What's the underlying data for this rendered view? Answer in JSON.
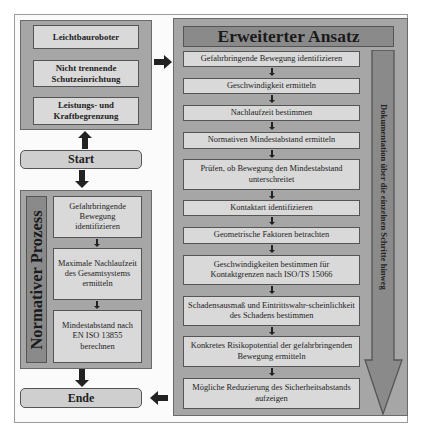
{
  "diagram": {
    "left_top_group": {
      "boxes": [
        "Leichtbauroboter",
        "Nicht trennende Schutzeinrichtung",
        "Leistungs- und Kraftbegrenzung"
      ]
    },
    "start_label": "Start",
    "normative": {
      "title": "Normativer Prozess",
      "steps": [
        "Gefahrbringende Bewegung identifizieren",
        "Maximale Nachlaufzeit des Gesamtsystems ermitteln",
        "Mindestabstand nach EN ISO 13855 berechnen"
      ]
    },
    "end_label": "Ende",
    "extended": {
      "title": "Erweiterter Ansatz",
      "steps": [
        "Gefahrbringende Bewegung identifizieren",
        "Geschwindigkeit ermitteln",
        "Nachlaufzeit bestimmen",
        "Normativen Mindestabstand ermitteln",
        "Prüfen, ob Bewegung den Mindestabstand unterschreitet",
        "Kontaktart identifizieren",
        "Geometrische Faktoren betrachten",
        "Geschwindigkeiten bestimmen für Kontaktgrenzen nach ISO/TS 15066",
        "Schadensausmaß und Eintrittswahr-scheinlichkeit des Schadens bestimmen",
        "Konkretes Risikopotential der gefahrbringenden Bewegung ermitteln",
        "Mögliche Reduzierung des Sicherheitsabstands aufzeigen"
      ],
      "documentation_label": "Dokumentation über die einzelnen Schritte hinweg"
    },
    "colors": {
      "group_fill": "#a6a6a6",
      "box_fill": "#d9d9d9",
      "header_fill": "#8a8a8a",
      "border": "#555555",
      "arrow": "#222222"
    }
  }
}
